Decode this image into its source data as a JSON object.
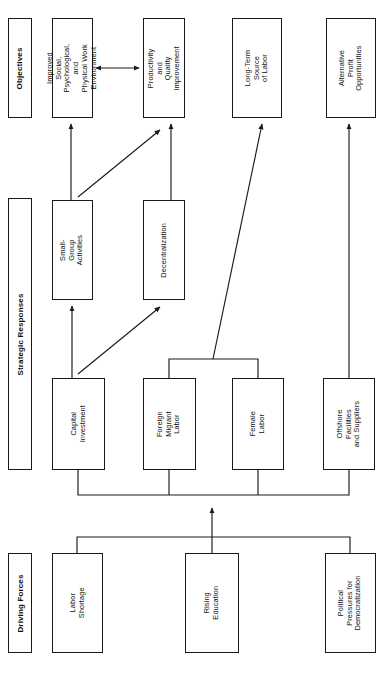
{
  "diagram": {
    "orientation": "rotated-90-landscape",
    "accent_color": "#1a1a1a",
    "background_color": "#ffffff",
    "bands": [
      {
        "id": "objectives",
        "label": "Objectives",
        "x": 8,
        "y": 18,
        "w": 24,
        "h": 100
      },
      {
        "id": "strategic-responses",
        "label": "Strategic Responses",
        "x": 8,
        "y": 198,
        "w": 24,
        "h": 272
      },
      {
        "id": "driving-forces",
        "label": "Driving Forces",
        "x": 8,
        "y": 553,
        "w": 24,
        "h": 100
      }
    ],
    "nodes": [
      {
        "id": "improved-work-environment",
        "group": "objectives",
        "label": "Improved Social,\nPsychological, and\nPhysical Work\nEnvironment",
        "x": 52,
        "y": 18,
        "w": 41,
        "h": 100,
        "font": 7.4
      },
      {
        "id": "productivity-quality",
        "group": "objectives",
        "label": "Productivity and\nQuality\nImprovement",
        "x": 143,
        "y": 18,
        "w": 42,
        "h": 100,
        "font": 7.4
      },
      {
        "id": "long-term-source-of-labor",
        "group": "objectives",
        "label": "Long-Term Source\nof Labor",
        "x": 232,
        "y": 18,
        "w": 50,
        "h": 100,
        "font": 7.4
      },
      {
        "id": "alternative-profit-opportunities",
        "group": "objectives",
        "label": "Alternative\nProfit\nOpportunities",
        "x": 326,
        "y": 18,
        "w": 50,
        "h": 100,
        "font": 7.4
      },
      {
        "id": "small-group-activities",
        "group": "strategic-responses",
        "label": "Small-Group\nActivities",
        "x": 52,
        "y": 200,
        "w": 41,
        "h": 100,
        "font": 7.4
      },
      {
        "id": "decentralization",
        "group": "strategic-responses",
        "label": "Decentralization",
        "x": 143,
        "y": 200,
        "w": 42,
        "h": 100,
        "font": 7.4
      },
      {
        "id": "capital-investment",
        "group": "strategic-responses",
        "label": "Capital\nInvestment",
        "x": 52,
        "y": 378,
        "w": 53,
        "h": 92,
        "font": 7.4
      },
      {
        "id": "foreign-migrant-labor",
        "group": "strategic-responses",
        "label": "Foreign\nMigrant\nLabor",
        "x": 143,
        "y": 378,
        "w": 53,
        "h": 92,
        "font": 7.4
      },
      {
        "id": "female-labor",
        "group": "strategic-responses",
        "label": "Female\nLabor",
        "x": 232,
        "y": 378,
        "w": 52,
        "h": 92,
        "font": 7.4
      },
      {
        "id": "offshore-facilities-and-suppliers",
        "group": "strategic-responses",
        "label": "Offshore\nFacilities\nand Suppliers",
        "x": 323,
        "y": 378,
        "w": 52,
        "h": 92,
        "font": 7.4
      },
      {
        "id": "labor-shortage",
        "group": "driving-forces",
        "label": "Labor\nShortage",
        "x": 52,
        "y": 553,
        "w": 51,
        "h": 100,
        "font": 7.4
      },
      {
        "id": "rising-education",
        "group": "driving-forces",
        "label": "Rising\nEducation",
        "x": 185,
        "y": 553,
        "w": 54,
        "h": 100,
        "font": 7.4
      },
      {
        "id": "political-pressures-for-democratization",
        "group": "driving-forces",
        "label": "Political\nPressures for\nDemocratization",
        "x": 325,
        "y": 553,
        "w": 51,
        "h": 100,
        "font": 7.4
      }
    ],
    "edges": [
      {
        "id": "driving-forces-bus-to-strategic-bus",
        "from": "driving-forces-bus",
        "to": "strategic-responses-bus",
        "kind": "arrow"
      },
      {
        "id": "capital-investment-to-small-group-activities",
        "from": "capital-investment",
        "to": "small-group-activities",
        "kind": "arrow"
      },
      {
        "id": "capital-investment-to-decentralization",
        "from": "capital-investment",
        "to": "decentralization",
        "kind": "arrow"
      },
      {
        "id": "small-group-activities-to-improved-work-environment",
        "from": "small-group-activities",
        "to": "improved-work-environment",
        "kind": "arrow"
      },
      {
        "id": "small-group-activities-to-productivity-quality",
        "from": "small-group-activities",
        "to": "productivity-quality",
        "kind": "arrow"
      },
      {
        "id": "decentralization-to-productivity-quality",
        "from": "decentralization",
        "to": "productivity-quality",
        "kind": "arrow"
      },
      {
        "id": "labor-bus-to-long-term-source-of-labor",
        "from": "foreign-migrant-labor-and-female-labor",
        "to": "long-term-source-of-labor",
        "kind": "arrow"
      },
      {
        "id": "offshore-to-alternative-profit-opportunities",
        "from": "offshore-facilities-and-suppliers",
        "to": "alternative-profit-opportunities",
        "kind": "arrow"
      },
      {
        "id": "improved-work-environment-to-productivity-quality",
        "from": "improved-work-environment",
        "to": "productivity-quality",
        "kind": "double-arrow"
      }
    ]
  }
}
